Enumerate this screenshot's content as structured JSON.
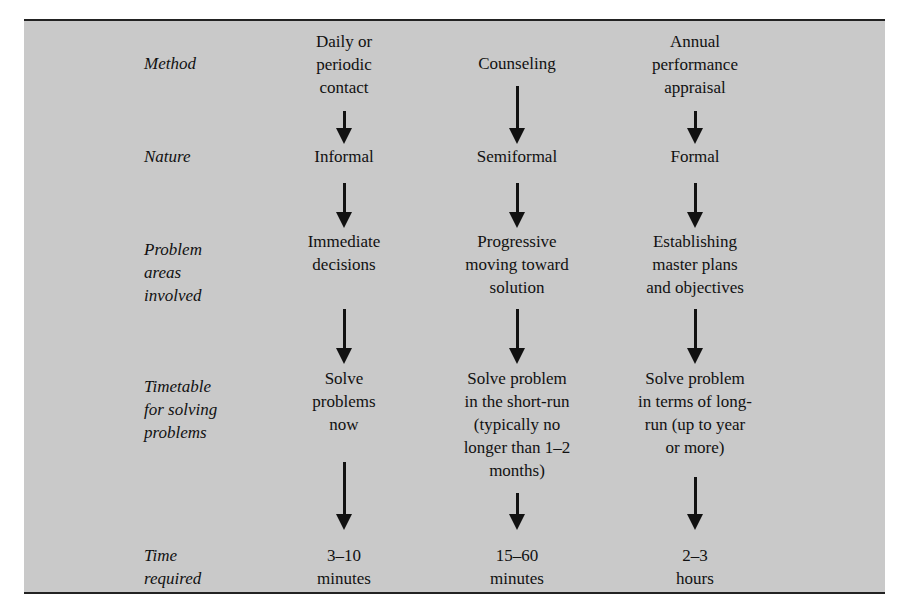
{
  "rows": [
    {
      "label": "Method",
      "cells": [
        "Daily or\nperiodic\ncontact",
        "Counseling",
        "Annual\nperformance\nappraisal"
      ]
    },
    {
      "label": "Nature",
      "cells": [
        "Informal",
        "Semiformal",
        "Formal"
      ]
    },
    {
      "label": "Problem\nareas\ninvolved",
      "cells": [
        "Immediate\ndecisions",
        "Progressive\nmoving toward\nsolution",
        "Establishing\nmaster plans\nand objectives"
      ]
    },
    {
      "label": "Timetable\nfor solving\nproblems",
      "cells": [
        "Solve\nproblems\nnow",
        "Solve problem\nin the short-run\n(typically no\nlonger than 1–2\nmonths)",
        "Solve problem\nin terms of long-\nrun (up to year\nor more)"
      ]
    },
    {
      "label": "Time\nrequired",
      "cells": [
        "3–10\nminutes",
        "15–60\nminutes",
        "2–3\nhours"
      ]
    }
  ],
  "colors": {
    "panel_background": "#c9c9c9",
    "rule": "#222222",
    "text": "#111111"
  }
}
